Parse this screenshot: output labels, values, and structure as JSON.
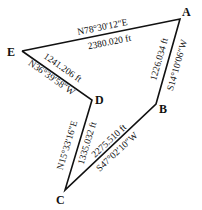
{
  "diagram": {
    "type": "traverse-polygon",
    "line_color": "#111111",
    "vertices": [
      {
        "id": "A",
        "label": "A",
        "x": 180,
        "y": 19
      },
      {
        "id": "B",
        "label": "B",
        "x": 156,
        "y": 104
      },
      {
        "id": "C",
        "label": "C",
        "x": 65,
        "y": 190
      },
      {
        "id": "D",
        "label": "D",
        "x": 92,
        "y": 100
      },
      {
        "id": "E",
        "label": "E",
        "x": 22,
        "y": 51
      }
    ],
    "edges": [
      {
        "from": "E",
        "to": "A",
        "bearing": "N78°30′12″E",
        "distance": "2380.020 ft"
      },
      {
        "from": "A",
        "to": "B",
        "bearing": "S14°10′06″W",
        "distance": "1226.034 ft"
      },
      {
        "from": "B",
        "to": "C",
        "bearing": "S47°02′10″W",
        "distance": "2275.510 ft"
      },
      {
        "from": "C",
        "to": "D",
        "bearing": "N15°33′16″E",
        "distance": "1335.032 ft"
      },
      {
        "from": "D",
        "to": "E",
        "bearing": "N36°39′58″W",
        "distance": "1241.206 ft"
      }
    ]
  }
}
